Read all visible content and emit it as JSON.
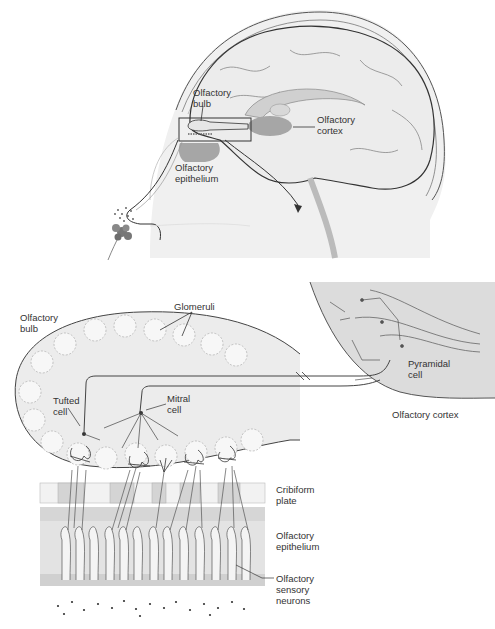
{
  "figure": {
    "type": "anatomical-diagram",
    "colors": {
      "outline": "#333333",
      "brain_fill": "#ececec",
      "skull_fill": "#e4e4e4",
      "region_fill": "#a6a6a6",
      "bulb_fill": "#e9e9e9",
      "epithelium_fill": "#dcdcdc",
      "cortex_fill": "#d8d8d8",
      "text": "#333333"
    }
  },
  "labels": {
    "top": {
      "olfactory_bulb": [
        "Olfactory",
        "bulb"
      ],
      "olfactory_cortex": [
        "Olfactory",
        "cortex"
      ],
      "olfactory_epithelium": [
        "Olfactory",
        "epithelium"
      ]
    },
    "bottom": {
      "olfactory_bulb": [
        "Olfactory",
        "bulb"
      ],
      "glomeruli": "Glomeruli",
      "tufted_cell": [
        "Tufted",
        "cell"
      ],
      "mitral_cell": [
        "Mitral",
        "cell"
      ],
      "pyramidal_cell": [
        "Pyramidal",
        "cell"
      ],
      "olfactory_cortex": "Olfactory cortex",
      "cribiform_plate": [
        "Cribiform",
        "plate"
      ],
      "olfactory_epithelium": [
        "Olfactory",
        "epithelium"
      ],
      "olfactory_sensory_neurons": [
        "Olfactory",
        "sensory",
        "neurons"
      ]
    }
  }
}
